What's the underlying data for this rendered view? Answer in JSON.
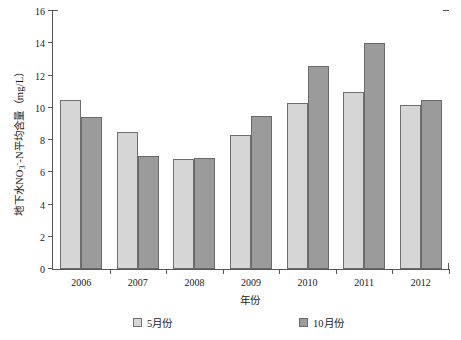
{
  "chart_data": {
    "type": "bar",
    "title": "",
    "xlabel": "年份",
    "ylabel_parts": {
      "pre": "地下水NO",
      "sub": "3",
      "sup": "-",
      "post": "-N平均含量（mg/L）"
    },
    "ylabel": "地下水NO3--N平均含量（mg/L）",
    "categories": [
      "2006",
      "2007",
      "2008",
      "2009",
      "2010",
      "2011",
      "2012"
    ],
    "series": [
      {
        "name": "5月份",
        "color": "#d6d6d6",
        "values": [
          10.5,
          8.5,
          6.8,
          8.3,
          10.3,
          11.0,
          10.2
        ]
      },
      {
        "name": "10月份",
        "color": "#9b9b9b",
        "values": [
          9.4,
          7.0,
          6.9,
          9.5,
          12.6,
          14.0,
          10.5
        ]
      }
    ],
    "ylim": [
      0,
      16
    ],
    "yticks": [
      0,
      2,
      4,
      6,
      8,
      10,
      12,
      14,
      16
    ],
    "ytick_labels": [
      "0",
      "2",
      "4",
      "6",
      "8",
      "10",
      "12",
      "14",
      "16"
    ],
    "grid": false,
    "legend_position": "bottom"
  }
}
